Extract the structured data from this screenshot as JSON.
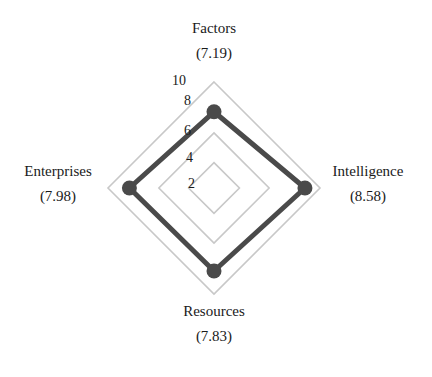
{
  "chart_data": {
    "type": "radar",
    "title": "",
    "axes": [
      "Factors",
      "Intelligence",
      "Resources",
      "Enterprises"
    ],
    "axis_value_labels": [
      "(7.19)",
      "(8.58)",
      "(7.83)",
      "(7.98)"
    ],
    "values": [
      7.19,
      8.58,
      7.83,
      7.98
    ],
    "series": [
      {
        "name": "Score",
        "values": [
          7.19,
          8.58,
          7.83,
          7.98
        ],
        "color": "#4a4a4a"
      }
    ],
    "radial_ticks": [
      "2",
      "4",
      "6",
      "8",
      "10"
    ],
    "rlim": [
      0,
      10
    ],
    "grid_levels": [
      2.4,
      5.2,
      10
    ],
    "grid": true,
    "legend": "none"
  },
  "colors": {
    "series_line": "#4a4a4a",
    "grid_line": "#c8c8c8",
    "text": "#1a1a1a"
  },
  "labels": {
    "top": {
      "name": "Factors",
      "value": "(7.19)"
    },
    "right": {
      "name": "Intelligence",
      "value": "(8.58)"
    },
    "bottom": {
      "name": "Resources",
      "value": "(7.83)"
    },
    "left": {
      "name": "Enterprises",
      "value": "(7.98)"
    }
  },
  "ticks": {
    "t10": "10",
    "t8": "8",
    "t6": "6",
    "t4": "4",
    "t2": "2"
  }
}
